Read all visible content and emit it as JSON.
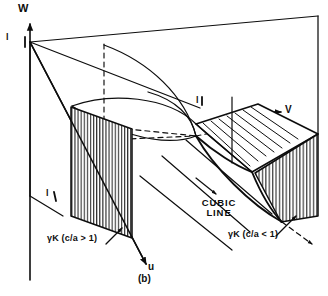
{
  "figure": {
    "caption": "(b)",
    "type": "3d-perspective-yield-surface-diagram",
    "background_color": "#ffffff",
    "line_color": "#0d0d0d"
  },
  "axes": {
    "vertical": {
      "name": "w-axis",
      "label": "W",
      "direction": "up"
    },
    "depth": {
      "name": "u-axis",
      "label": "u",
      "direction": "down-right"
    },
    "horizontal": {
      "name": "v-axis",
      "label": "V",
      "direction": "right"
    }
  },
  "ticks": [
    {
      "name": "origin-tick",
      "label": "l"
    },
    {
      "name": "left-panel-tick",
      "label": "l"
    },
    {
      "name": "ribbon-top-tick",
      "label": "l"
    }
  ],
  "annotations": [
    {
      "name": "gamma-k-ca-greater-than-one",
      "text": "γK (c/a > 1)",
      "target": "left-hatched-panel"
    },
    {
      "name": "cubic-line",
      "text": "CUBIC\nLINE",
      "line1": "CUBIC",
      "line2": "LINE",
      "target": "cubic-line-rays"
    },
    {
      "name": "gamma-k-ca-less-than-one",
      "text": "γK (c/a < 1)",
      "target": "right-hatched-end-cap"
    }
  ],
  "regions": [
    {
      "name": "left-hatched-panel",
      "hatch": "vertical",
      "fill": "#ffffff"
    },
    {
      "name": "right-hatched-end-cap",
      "hatch": "vertical",
      "fill": "#ffffff"
    },
    {
      "name": "ribbon-surface",
      "hatch": "horizontal-ruled",
      "fill": "#ffffff"
    },
    {
      "name": "outer-box-wireframe",
      "hatch": "none",
      "fill": "none"
    },
    {
      "name": "paraboloid-cap",
      "hatch": "none",
      "fill": "none"
    }
  ]
}
